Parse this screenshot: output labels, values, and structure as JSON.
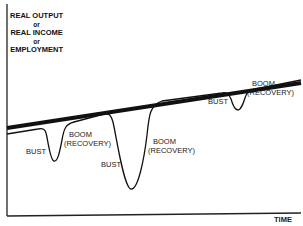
{
  "diagram": {
    "y_axis_label": {
      "line1": "REAL OUTPUT",
      "line2": "or",
      "line3": "REAL INCOME",
      "line4": "or",
      "line5": "EMPLOYMENT"
    },
    "x_axis_label": "TIME",
    "annotations": [
      {
        "id": "bust1",
        "text": "BUST"
      },
      {
        "id": "boom1_a",
        "text": "BOOM"
      },
      {
        "id": "boom1_b",
        "text": "(RECOVERY)"
      },
      {
        "id": "bust2",
        "text": "BUST"
      },
      {
        "id": "boom2_a",
        "text": "BOOM"
      },
      {
        "id": "boom2_b",
        "text": "(RECOVERY)"
      },
      {
        "id": "bust3",
        "text": "BUST"
      },
      {
        "id": "boom3_a",
        "text": "BOOM"
      },
      {
        "id": "boom3_b",
        "text": "(RECOVERY)"
      }
    ],
    "colors": {
      "line": "#111111",
      "background": "#ffffff"
    }
  }
}
